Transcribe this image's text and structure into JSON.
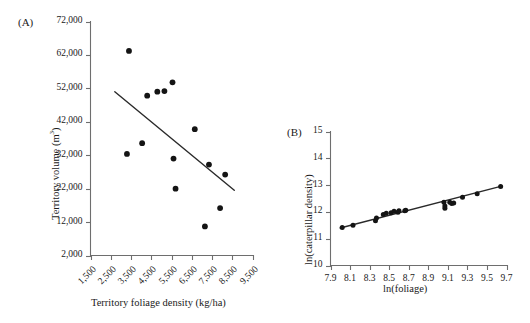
{
  "figure": {
    "panels": [
      {
        "id": "A",
        "label": "(A)",
        "xlabel": "Territory foliage density (kg/ha)",
        "ylabel_main": "Territory volume (m",
        "ylabel_sup": "3",
        "ylabel_tail": ")"
      },
      {
        "id": "B",
        "label": "(B)",
        "xlabel": "ln(foliage)",
        "ylabel": "ln(caterpillar density)"
      }
    ]
  },
  "chart_data": [
    {
      "type": "scatter",
      "panel": "A",
      "title": "",
      "xlabel": "Territory foliage density (kg/ha)",
      "ylabel": "Territory volume (m3)",
      "xlim": [
        1500,
        9500
      ],
      "ylim": [
        2000,
        72000
      ],
      "xticks": [
        1500,
        2500,
        3500,
        4500,
        5500,
        6500,
        7500,
        8500,
        9500
      ],
      "xtick_labels": [
        "1,500",
        "2,500",
        "3,500",
        "4,500",
        "5,500",
        "6,500",
        "7,500",
        "8,500",
        "9,500"
      ],
      "yticks": [
        2000,
        12000,
        22000,
        32000,
        42000,
        52000,
        62000,
        72000
      ],
      "ytick_labels": [
        "2,000",
        "12,000",
        "22,000",
        "32,000",
        "42,000",
        "52,000",
        "62,000",
        "72,000"
      ],
      "grid": false,
      "legend": "none",
      "x": [
        3400,
        3300,
        4050,
        5150,
        5550,
        4800,
        4300,
        5600,
        8150,
        3900,
        6650,
        5700,
        7350,
        7900,
        7150
      ],
      "y": [
        63200,
        32400,
        35600,
        51200,
        53800,
        51000,
        49800,
        31000,
        39800,
        31300,
        22000,
        22000,
        29200,
        26200,
        10700
      ],
      "points": [
        {
          "x": 3400,
          "y": 63200
        },
        {
          "x": 3300,
          "y": 32400
        },
        {
          "x": 4050,
          "y": 35600
        },
        {
          "x": 4300,
          "y": 49800
        },
        {
          "x": 4800,
          "y": 51000
        },
        {
          "x": 5150,
          "y": 51200
        },
        {
          "x": 5550,
          "y": 53800
        },
        {
          "x": 5600,
          "y": 31000
        },
        {
          "x": 5700,
          "y": 22000
        },
        {
          "x": 6650,
          "y": 39800
        },
        {
          "x": 7150,
          "y": 10700
        },
        {
          "x": 7350,
          "y": 29200
        },
        {
          "x": 7900,
          "y": 16200
        },
        {
          "x": 8150,
          "y": 26200
        }
      ],
      "fit_line": {
        "type": "linear",
        "x_start": 2700,
        "y_start": 51000,
        "x_end": 8600,
        "y_end": 21500
      }
    },
    {
      "type": "scatter",
      "panel": "B",
      "title": "",
      "xlabel": "ln(foliage)",
      "ylabel": "ln(caterpillar density)",
      "xlim": [
        7.9,
        9.7
      ],
      "ylim": [
        10,
        15
      ],
      "xticks": [
        7.9,
        8.1,
        8.3,
        8.5,
        8.7,
        8.9,
        9.1,
        9.3,
        9.5,
        9.7
      ],
      "xtick_labels": [
        "7.9",
        "8.1",
        "8.3",
        "8.5",
        "8.7",
        "8.9",
        "9.1",
        "9.3",
        "9.5",
        "9.7"
      ],
      "yticks": [
        10,
        11,
        12,
        13,
        14,
        15
      ],
      "ytick_labels": [
        "10",
        "11",
        "12",
        "13",
        "14",
        "15"
      ],
      "grid": false,
      "legend": "none",
      "x": [
        8.02,
        8.13,
        8.36,
        8.37,
        8.44,
        8.47,
        8.52,
        8.55,
        8.59,
        8.6,
        8.66,
        8.67,
        9.06,
        9.07,
        9.07,
        9.12,
        9.14,
        9.16,
        9.25,
        9.4,
        9.64
      ],
      "y": [
        11.42,
        11.5,
        11.67,
        11.77,
        11.9,
        11.95,
        11.97,
        12.02,
        11.99,
        12.04,
        12.04,
        12.06,
        12.36,
        12.22,
        12.14,
        12.36,
        12.31,
        12.33,
        12.55,
        12.68,
        12.95
      ],
      "points": [
        {
          "x": 8.02,
          "y": 11.42
        },
        {
          "x": 8.13,
          "y": 11.5
        },
        {
          "x": 8.36,
          "y": 11.67
        },
        {
          "x": 8.37,
          "y": 11.77
        },
        {
          "x": 8.44,
          "y": 11.9
        },
        {
          "x": 8.47,
          "y": 11.95
        },
        {
          "x": 8.52,
          "y": 11.97
        },
        {
          "x": 8.55,
          "y": 12.02
        },
        {
          "x": 8.59,
          "y": 11.99
        },
        {
          "x": 8.6,
          "y": 12.04
        },
        {
          "x": 8.66,
          "y": 12.04
        },
        {
          "x": 8.67,
          "y": 12.06
        },
        {
          "x": 9.06,
          "y": 12.36
        },
        {
          "x": 9.07,
          "y": 12.22
        },
        {
          "x": 9.07,
          "y": 12.14
        },
        {
          "x": 9.12,
          "y": 12.36
        },
        {
          "x": 9.14,
          "y": 12.31
        },
        {
          "x": 9.16,
          "y": 12.33
        },
        {
          "x": 9.25,
          "y": 12.55
        },
        {
          "x": 9.4,
          "y": 12.68
        },
        {
          "x": 9.64,
          "y": 12.95
        }
      ],
      "fit_line": {
        "type": "linear",
        "x_start": 8.0,
        "y_start": 11.4,
        "x_end": 9.65,
        "y_end": 12.96
      }
    }
  ]
}
